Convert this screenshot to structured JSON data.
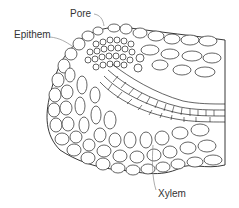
{
  "diagram": {
    "labels": [
      {
        "id": "pore",
        "text": "Pore",
        "x": 70,
        "y": 11
      },
      {
        "id": "epithem",
        "text": "Epithem",
        "x": 14,
        "y": 31
      },
      {
        "id": "xylem",
        "text": "Xylem",
        "x": 158,
        "y": 190
      }
    ],
    "colors": {
      "line": "#222222",
      "leader": "#888888",
      "text": "#333333",
      "background": "#ffffff"
    }
  }
}
